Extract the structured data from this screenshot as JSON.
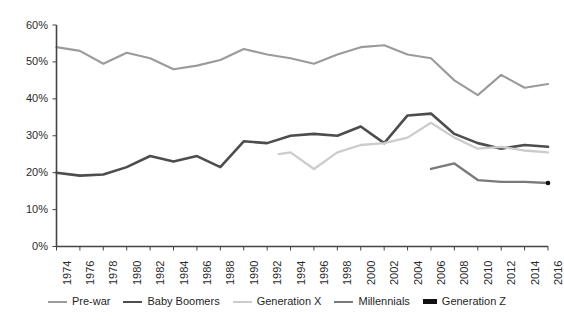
{
  "chart_data": {
    "type": "line",
    "title": "",
    "subtitle": "",
    "xlabel": "",
    "ylabel": "",
    "xlim": [
      1974,
      2016
    ],
    "ylim": [
      0,
      60
    ],
    "grid": false,
    "legend_position": "bottom",
    "y_ticks": [
      "0%",
      "10%",
      "20%",
      "30%",
      "40%",
      "50%",
      "60%"
    ],
    "y_tick_values": [
      0,
      10,
      20,
      30,
      40,
      50,
      60
    ],
    "x_ticks": [
      "1974",
      "1976",
      "1978",
      "1980",
      "1982",
      "1984",
      "1986",
      "1988",
      "1990",
      "1992",
      "1994",
      "1996",
      "1998",
      "2000",
      "2002",
      "2004",
      "2006",
      "2008",
      "2010",
      "2012",
      "2014",
      "2016"
    ],
    "x_tick_values": [
      1974,
      1976,
      1978,
      1980,
      1982,
      1984,
      1986,
      1988,
      1990,
      1992,
      1994,
      1996,
      1998,
      2000,
      2002,
      2004,
      2006,
      2008,
      2010,
      2012,
      2014,
      2016
    ],
    "series": [
      {
        "name": "Pre-war",
        "color": "#9b9b9b",
        "width": 2.1,
        "x": [
          1974,
          1976,
          1978,
          1980,
          1982,
          1984,
          1986,
          1988,
          1990,
          1992,
          1994,
          1996,
          1998,
          2000,
          2002,
          2004,
          2006,
          2008,
          2010,
          2012,
          2014,
          2016
        ],
        "values": [
          54.0,
          53.0,
          49.5,
          52.5,
          51.0,
          48.0,
          49.0,
          50.5,
          53.5,
          52.0,
          51.0,
          49.5,
          52.0,
          54.0,
          54.5,
          52.0,
          51.0,
          45.0,
          41.0,
          46.5,
          43.0,
          44.0
        ]
      },
      {
        "name": "Baby Boomers",
        "color": "#4d4d4d",
        "width": 2.6,
        "x": [
          1974,
          1976,
          1978,
          1980,
          1982,
          1984,
          1986,
          1988,
          1990,
          1992,
          1994,
          1996,
          1998,
          2000,
          2002,
          2004,
          2006,
          2008,
          2010,
          2012,
          2014,
          2016
        ],
        "values": [
          20.0,
          19.2,
          19.5,
          21.5,
          24.5,
          23.0,
          24.5,
          21.5,
          28.5,
          28.0,
          30.0,
          30.5,
          30.0,
          32.5,
          28.0,
          35.5,
          36.0,
          30.5,
          28.0,
          26.5,
          27.5,
          27.0
        ]
      },
      {
        "name": "Generation X",
        "color": "#cccccc",
        "width": 2.3,
        "x": [
          1993,
          1994,
          1996,
          1998,
          2000,
          2002,
          2004,
          2006,
          2008,
          2010,
          2012,
          2014,
          2016
        ],
        "values": [
          25.0,
          25.5,
          21.0,
          25.5,
          27.5,
          28.0,
          29.5,
          33.5,
          29.5,
          26.5,
          27.0,
          26.0,
          25.5
        ]
      },
      {
        "name": "Millennials",
        "color": "#7a7a7a",
        "width": 2.3,
        "x": [
          2006,
          2008,
          2010,
          2012,
          2014,
          2016
        ],
        "values": [
          21.0,
          22.5,
          18.0,
          17.5,
          17.5,
          17.2
        ]
      },
      {
        "name": "Generation Z",
        "color": "#111111",
        "width": 2.6,
        "x": [
          2016
        ],
        "values": [
          17.2
        ]
      }
    ]
  },
  "axes": {
    "axis_color": "#444444"
  }
}
